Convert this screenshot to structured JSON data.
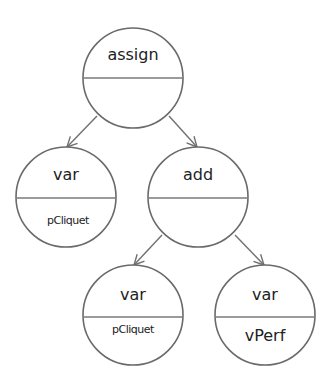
{
  "diagram": {
    "title": "",
    "nodes": [
      {
        "id": "n0",
        "type": "assign",
        "value": "",
        "cx": 133,
        "cy": 78
      },
      {
        "id": "n1",
        "type": "var",
        "value": "pCliquet",
        "cx": 66,
        "cy": 197
      },
      {
        "id": "n2",
        "type": "add",
        "value": "",
        "cx": 198,
        "cy": 197
      },
      {
        "id": "n3",
        "type": "var",
        "value": "pCliquet",
        "cx": 133,
        "cy": 315
      },
      {
        "id": "n4",
        "type": "var",
        "value": "vPerf",
        "cx": 265,
        "cy": 315
      }
    ],
    "edges": [
      {
        "from": "n0",
        "to": "n1"
      },
      {
        "from": "n0",
        "to": "n2"
      },
      {
        "from": "n2",
        "to": "n3"
      },
      {
        "from": "n2",
        "to": "n4"
      }
    ],
    "colors": {
      "stroke": "#6a6a6a",
      "text": "#222222",
      "background": "#ffffff"
    }
  }
}
